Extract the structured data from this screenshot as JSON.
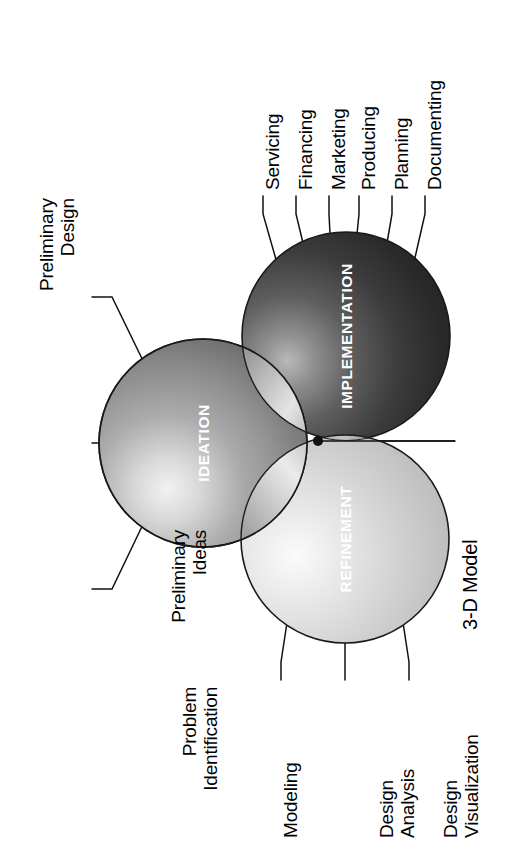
{
  "diagram": {
    "orientation": "rotated-90-clockwise",
    "spheres": [
      {
        "id": "ideation",
        "label": "IDEATION",
        "tone": "medium-gray",
        "color": "#8d8d8d"
      },
      {
        "id": "implementation",
        "label": "IMPLEMENTATION",
        "tone": "dark-gray",
        "color": "#3a3a3a"
      },
      {
        "id": "refinement",
        "label": "REFINEMENT",
        "tone": "light-gray",
        "color": "#c9c9c9"
      }
    ],
    "center_callout": {
      "label": "3-D Model"
    },
    "ideation_callouts": [
      {
        "label": "Preliminary\nDesign"
      },
      {
        "label": "Preliminary\nIdeas"
      },
      {
        "label": "Problem\nIdentification"
      }
    ],
    "implementation_callouts": [
      {
        "label": "Servicing"
      },
      {
        "label": "Financing"
      },
      {
        "label": "Marketing"
      },
      {
        "label": "Producing"
      },
      {
        "label": "Planning"
      },
      {
        "label": "Documenting"
      }
    ],
    "refinement_callouts": [
      {
        "label": "Modeling"
      },
      {
        "label": "Design\nAnalysis"
      },
      {
        "label": "Design\nVisualization"
      }
    ],
    "colors": {
      "background": "#ffffff",
      "stroke": "#1a1a1a",
      "label_text": "#000000",
      "sphere_text": "#ffffff"
    }
  }
}
